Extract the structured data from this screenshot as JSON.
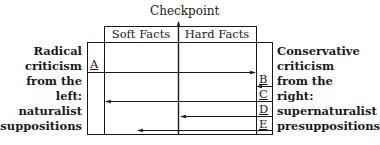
{
  "diagram": {
    "title": "Checkpoint",
    "columns": [
      {
        "label": "Soft Facts"
      },
      {
        "label": "Hard Facts"
      }
    ],
    "left_label": [
      "Radical",
      "criticism",
      "from the",
      "left:",
      "naturalist",
      "presuppositions"
    ],
    "right_label": [
      "Conservative",
      "criticism",
      "from the",
      "right:",
      "supernaturalist",
      "presuppositions"
    ],
    "rows": [
      {
        "letter": "A",
        "direction": "right",
        "from": "left edge",
        "to": "right inner line"
      },
      {
        "letter": "B",
        "direction": "left",
        "from": "right inner line",
        "to": "right inner line (short)"
      },
      {
        "letter": "C",
        "direction": "left",
        "from": "right edge",
        "to": "left inner line"
      },
      {
        "letter": "D",
        "direction": "left",
        "from": "right edge",
        "to": "checkpoint"
      },
      {
        "letter": "E",
        "direction": "left",
        "from": "right edge",
        "to": "soft facts region"
      }
    ],
    "line_color": "#1a1a1a"
  }
}
